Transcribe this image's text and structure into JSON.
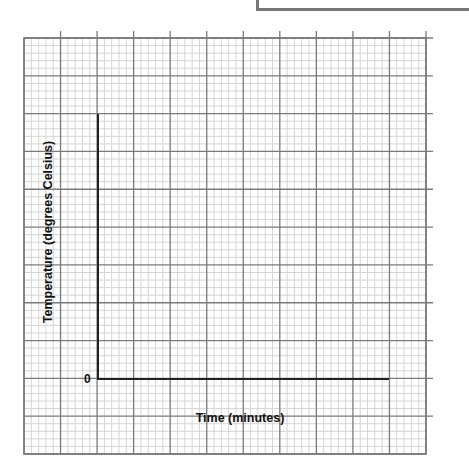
{
  "chart_data": {
    "type": "line",
    "title": "",
    "xlabel": "Time (minutes)",
    "ylabel": "Temperature (degrees Celsius)",
    "origin_label": "0",
    "series": [],
    "grid": true,
    "grid_major_columns": 11,
    "grid_major_rows": 11,
    "grid_minor_per_major": 5,
    "legend": null
  },
  "labels": {
    "x_axis": "Time (minutes)",
    "y_axis": "Temperature (degrees Celsius)",
    "origin": "0"
  },
  "colors": {
    "minor_grid": "#d4d4d4",
    "major_grid": "#7a7a7a",
    "axis": "#222222",
    "box_border": "#777777"
  }
}
